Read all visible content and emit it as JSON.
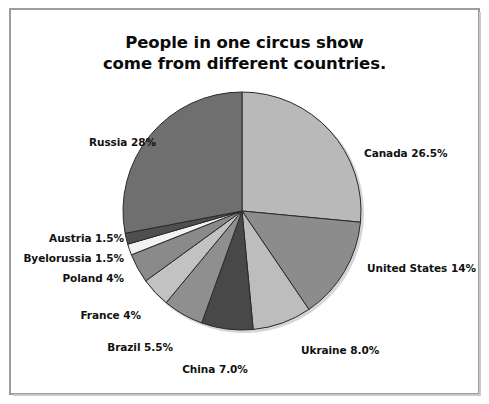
{
  "page": {
    "background": "#ffffff",
    "frame_color": "#9d9d9d"
  },
  "title": {
    "line1": "People in one circus show",
    "line2": "come from different countries."
  },
  "chart_data": {
    "type": "pie",
    "title": "People in one circus show come from different countries.",
    "subtitle": "",
    "xlabel": "",
    "ylabel": "",
    "legend_position": "none",
    "labels_outside": true,
    "start_angle_deg": 0,
    "direction": "clockwise",
    "total": 100,
    "units": "%",
    "categories": [
      "Canada",
      "United States",
      "Ukraine",
      "China",
      "Brazil",
      "France",
      "Poland",
      "Byelorussia",
      "Austria",
      "Russia"
    ],
    "values": [
      26.5,
      14,
      8.0,
      7.0,
      5.5,
      4,
      4,
      1.5,
      1.5,
      28
    ],
    "slices": [
      {
        "name": "Canada",
        "value": 26.5,
        "label": "Canada 26.5%",
        "color": "#b9b9b9",
        "label_side": "right"
      },
      {
        "name": "United States",
        "value": 14,
        "label": "United States 14%",
        "color": "#8c8c8c",
        "label_side": "right"
      },
      {
        "name": "Ukraine",
        "value": 8.0,
        "label": "Ukraine 8.0%",
        "color": "#bdbdbd",
        "label_side": "right"
      },
      {
        "name": "China",
        "value": 7.0,
        "label": "China 7.0%",
        "color": "#484848",
        "label_side": "bottom"
      },
      {
        "name": "Brazil",
        "value": 5.5,
        "label": "Brazil 5.5%",
        "color": "#8f8f8f",
        "label_side": "left"
      },
      {
        "name": "France",
        "value": 4,
        "label": "France 4%",
        "color": "#c2c2c2",
        "label_side": "left"
      },
      {
        "name": "Poland",
        "value": 4,
        "label": "Poland 4%",
        "color": "#8a8a8a",
        "label_side": "left"
      },
      {
        "name": "Byelorussia",
        "value": 1.5,
        "label": "Byelorussia 1.5%",
        "color": "#f2f2f2",
        "label_side": "left"
      },
      {
        "name": "Austria",
        "value": 1.5,
        "label": "Austria 1.5%",
        "color": "#4f4f4f",
        "label_side": "left"
      },
      {
        "name": "Russia",
        "value": 28,
        "label": "Russia 28%",
        "color": "#6f6f6f",
        "label_side": "left"
      }
    ]
  }
}
